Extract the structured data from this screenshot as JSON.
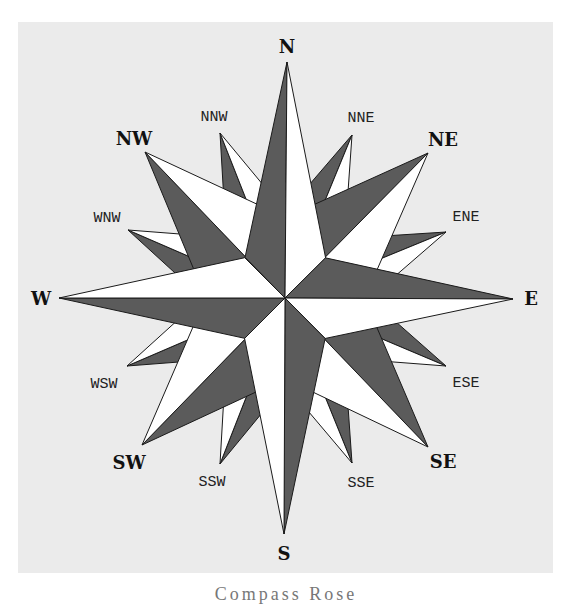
{
  "figure": {
    "center": [
      285,
      298
    ],
    "colors": {
      "panel_bg": "#ebebeb",
      "dark_half": "#5b5b5b",
      "light_half": "#ffffff",
      "outline": "#1a1a1a"
    },
    "caption": "Compass Rose"
  },
  "points": {
    "cardinal": [
      {
        "label": "N",
        "tip": [
          287,
          62
        ],
        "label_pos": [
          287,
          53
        ]
      },
      {
        "label": "E",
        "tip": [
          513,
          299
        ],
        "label_pos": [
          531,
          305
        ]
      },
      {
        "label": "S",
        "tip": [
          284,
          534
        ],
        "label_pos": [
          284,
          560
        ]
      },
      {
        "label": "W",
        "tip": [
          59,
          298
        ],
        "label_pos": [
          41,
          305
        ]
      }
    ],
    "intercardinal": [
      {
        "label": "NE",
        "tip": [
          428,
          153
        ],
        "label_pos": [
          443,
          146
        ]
      },
      {
        "label": "SE",
        "tip": [
          428,
          447
        ],
        "label_pos": [
          443,
          468
        ]
      },
      {
        "label": "SW",
        "tip": [
          142,
          445
        ],
        "label_pos": [
          129,
          469
        ]
      },
      {
        "label": "NW",
        "tip": [
          145,
          152
        ],
        "label_pos": [
          134,
          145
        ]
      }
    ],
    "secondary_intercardinal": [
      {
        "label": "NNE",
        "tip": [
          352,
          135
        ],
        "label_pos": [
          361,
          122
        ]
      },
      {
        "label": "ENE",
        "tip": [
          446,
          232
        ],
        "label_pos": [
          466,
          221
        ]
      },
      {
        "label": "ESE",
        "tip": [
          446,
          366
        ],
        "label_pos": [
          466,
          387
        ]
      },
      {
        "label": "SSE",
        "tip": [
          352,
          463
        ],
        "label_pos": [
          361,
          487
        ]
      },
      {
        "label": "SSW",
        "tip": [
          220,
          464
        ],
        "label_pos": [
          212,
          486
        ]
      },
      {
        "label": "WSW",
        "tip": [
          127,
          366
        ],
        "label_pos": [
          104,
          388
        ]
      },
      {
        "label": "WNW",
        "tip": [
          128,
          230
        ],
        "label_pos": [
          107,
          222
        ]
      },
      {
        "label": "NNW",
        "tip": [
          220,
          133
        ],
        "label_pos": [
          214,
          121
        ]
      }
    ]
  }
}
